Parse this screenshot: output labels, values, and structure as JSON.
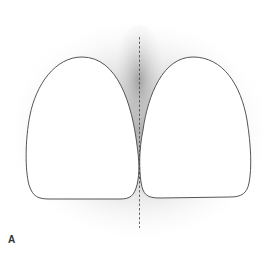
{
  "figure": {
    "panel_label": "A",
    "elements": [
      {
        "name": "left-tooth-outline",
        "shape": "rounded crown"
      },
      {
        "name": "right-tooth-outline",
        "shape": "rounded crown"
      },
      {
        "name": "midline",
        "style": "dashed vertical line"
      },
      {
        "name": "shadow-halo",
        "style": "soft gray gradient behind teeth"
      }
    ]
  },
  "colors": {
    "outline": "#555555",
    "tooth_fill": "#ffffff",
    "shadow": "#9a9a9a",
    "midline": "#444444",
    "background": "#ffffff"
  }
}
